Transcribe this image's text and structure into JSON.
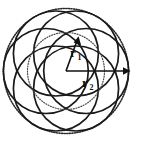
{
  "figure": {
    "name": "rosette-radii-diagram",
    "background_color": "#ffffff",
    "ink_color": "#1a1a1a",
    "center": {
      "x": 66,
      "y": 71
    },
    "outer_radius": 63,
    "inner_radius": 39,
    "petal_count": 6
  },
  "labels": {
    "inner_radius_label": "r",
    "inner_radius_subscript": "1",
    "outer_radius_label": "r",
    "outer_radius_subscript": "2"
  },
  "geometry": {
    "inner_arrow": {
      "from_x": 66,
      "from_y": 71,
      "to_x": 78,
      "to_y": 38,
      "angle_deg": 70
    },
    "outer_arrow": {
      "from_x": 66,
      "from_y": 71,
      "to_x": 130,
      "to_y": 71,
      "angle_deg": 0
    },
    "petal_circle_radius": 43,
    "petal_center_offset": 21
  }
}
